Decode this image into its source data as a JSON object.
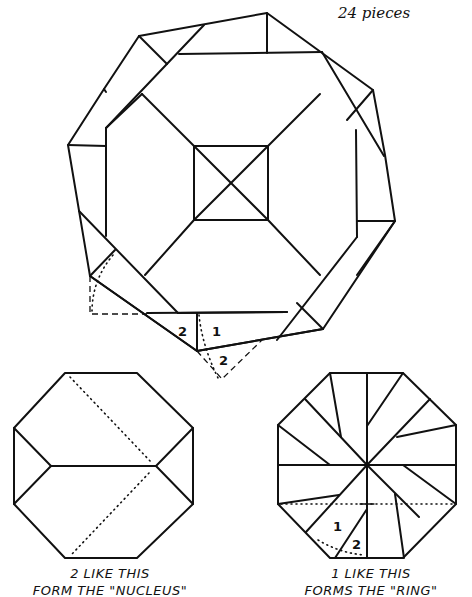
{
  "header": {
    "piece_count_note": "24 pieces"
  },
  "top_figure": {
    "labels": [
      "2",
      "1",
      "2"
    ]
  },
  "nucleus_figure": {
    "caption_line1": "2 LIKE THIS",
    "caption_line2": "FORM THE \"NUCLEUS\""
  },
  "ring_figure": {
    "labels": [
      "1",
      "2"
    ],
    "caption_line1": "1 LIKE THIS",
    "caption_line2": "FORMS THE \"RING\""
  },
  "colors": {
    "ink": "#111111",
    "paper": "#ffffff"
  }
}
